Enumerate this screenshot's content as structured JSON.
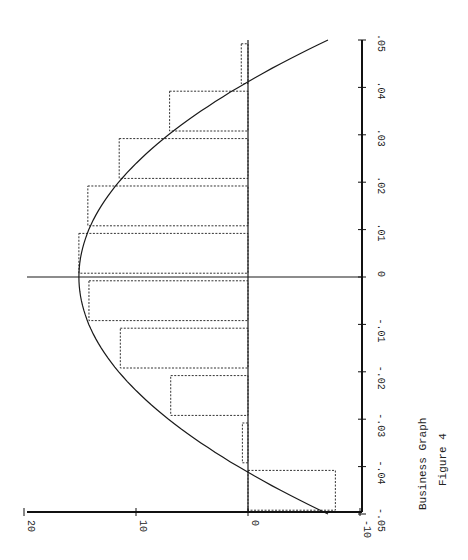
{
  "chart_data": {
    "type": "bar",
    "orientation": "rotated-90",
    "title": "Business Graph",
    "subtitle": "Figure 4",
    "xlabel": "",
    "ylabel": "",
    "categories": [
      ".045",
      ".035",
      ".025",
      ".015",
      ".005",
      "-.005",
      "-.015",
      "-.025",
      "-.035",
      "-.045"
    ],
    "series": [
      {
        "name": "histogram",
        "style": "dotted-outline-bars",
        "values": [
          0.6,
          7.0,
          11.5,
          14.3,
          15.1,
          14.2,
          11.4,
          6.9,
          0.5,
          -7.8
        ]
      },
      {
        "name": "fitted curve",
        "style": "solid-line",
        "x": [
          0.05,
          0.045,
          0.04,
          0.03,
          0.02,
          0.01,
          0.0,
          -0.01,
          -0.02,
          -0.03,
          -0.04,
          -0.045,
          -0.05
        ],
        "values": [
          -7.5,
          -3.4,
          0.2,
          6.9,
          11.6,
          14.4,
          15.1,
          14.3,
          11.4,
          6.6,
          0.0,
          -3.6,
          -7.5
        ]
      }
    ],
    "category_axis": {
      "ticks": [
        ".05",
        ".04",
        ".03",
        ".02",
        ".01",
        "0",
        "-.01",
        "-.02",
        "-.03",
        "-.04",
        "-.05"
      ],
      "range": [
        -0.05,
        0.05
      ]
    },
    "value_axis": {
      "ticks": [
        "20",
        "10",
        "0",
        "-10"
      ],
      "range": [
        -10,
        20
      ]
    },
    "grid": false,
    "legend": "none",
    "reference_lines": [
      "value = 0",
      "category = 0"
    ]
  },
  "captions": {
    "title": "Business Graph",
    "figure": "Figure 4"
  }
}
